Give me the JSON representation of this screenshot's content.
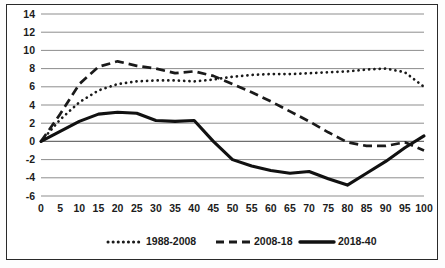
{
  "chart_data": {
    "type": "line",
    "title": "",
    "subtitle": "",
    "xlabel": "",
    "ylabel": "",
    "xlim": [
      0,
      100
    ],
    "ylim": [
      -6,
      14
    ],
    "ytick_step": 2,
    "xtick_step": 5,
    "grid": true,
    "legend_position": "bottom",
    "xticks": [
      0,
      5,
      10,
      15,
      20,
      25,
      30,
      35,
      40,
      45,
      50,
      55,
      60,
      65,
      70,
      75,
      80,
      85,
      90,
      95,
      100
    ],
    "yticks": [
      14,
      12,
      10,
      8,
      6,
      4,
      2,
      0,
      -2,
      -4,
      -6
    ],
    "x": [
      0,
      5,
      10,
      15,
      20,
      25,
      30,
      35,
      40,
      45,
      50,
      55,
      60,
      65,
      70,
      75,
      80,
      85,
      90,
      95,
      100
    ],
    "series": [
      {
        "name": "1988-2008",
        "style": "dotted",
        "color": "#1a1a1a",
        "values": [
          0,
          2.4,
          4.3,
          5.6,
          6.3,
          6.6,
          6.7,
          6.7,
          6.6,
          6.8,
          7.1,
          7.3,
          7.4,
          7.4,
          7.5,
          7.6,
          7.7,
          7.9,
          8.0,
          7.6,
          6.0
        ]
      },
      {
        "name": "2008-18",
        "style": "dashed",
        "color": "#1a1a1a",
        "values": [
          0,
          3.0,
          6.3,
          8.2,
          8.8,
          8.3,
          8.0,
          7.5,
          7.7,
          7.2,
          6.3,
          5.4,
          4.4,
          3.3,
          2.2,
          1.0,
          -0.1,
          -0.5,
          -0.5,
          -0.1,
          -1.0
        ]
      },
      {
        "name": "2018-40",
        "style": "solid",
        "color": "#111111",
        "values": [
          0,
          1.1,
          2.2,
          3.0,
          3.2,
          3.1,
          2.3,
          2.2,
          2.3,
          0.0,
          -2.0,
          -2.7,
          -3.2,
          -3.5,
          -3.3,
          -4.1,
          -4.8,
          -3.5,
          -2.2,
          -0.7,
          0.6
        ]
      }
    ],
    "series_corrected_note": ""
  },
  "legend": {
    "items": [
      {
        "label": "1988-2008",
        "style": "dotted"
      },
      {
        "label": "2008-18",
        "style": "dashed"
      },
      {
        "label": "2018-40",
        "style": "solid"
      }
    ]
  }
}
